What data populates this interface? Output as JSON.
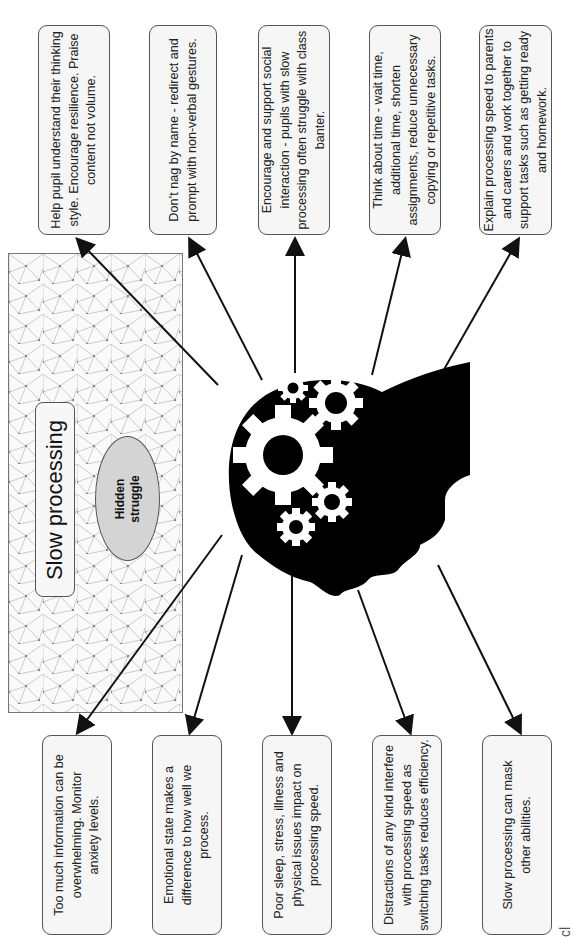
{
  "diagram": {
    "title": "Slow processing",
    "center_label": "Hidden struggle",
    "central_image": "head-with-gears-silhouette",
    "top_boxes": [
      {
        "text": "Help pupil understand their thinking style. Encourage resilience. Praise content not volume."
      },
      {
        "text": "Don’t nag by name - redirect and prompt with non-verbal gestures."
      },
      {
        "text": "Encourage and support social interaction - pupils with slow processing often struggle with class banter."
      },
      {
        "text": "Think about time - wait time, additional time, shorten assignments, reduce unnecessary copying or repetitive tasks."
      },
      {
        "text": "Explain processing speed to parents and carers and work together to support tasks such as getting ready and homework."
      }
    ],
    "bottom_boxes": [
      {
        "text": "Too much information can be overwhelming. Monitor anxiety levels."
      },
      {
        "text": "Emotional state makes a difference to how well we process."
      },
      {
        "text": "Poor sleep, stress, illness and physical issues impact on processing speed."
      },
      {
        "text": "Distractions of any kind interfere with processing speed as switching tasks reduces efficiency."
      },
      {
        "text": "Slow processing can mask other abilities."
      }
    ],
    "corner_fragment": "cl",
    "colors": {
      "box_fill": "#f6f6f6",
      "box_border": "#555555",
      "ellipse_fill": "#d4d4d4",
      "head_fill": "#000000",
      "gear_fill": "#ffffff",
      "arrow": "#111111",
      "network_line": "#b0b0b0"
    }
  }
}
